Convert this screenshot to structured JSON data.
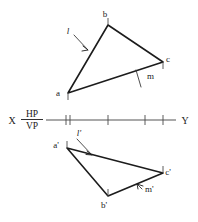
{
  "figure": {
    "width": 198,
    "height": 222,
    "background_color": "#ffffff",
    "line_color": "#1c1c1c",
    "leader_color": "#3a3a3a",
    "axis_color": "#555555"
  },
  "reference_line": {
    "name": "XY line",
    "left_label": "X",
    "right_label": "Y",
    "upper_plane_label": "HP",
    "lower_plane_label": "VP",
    "x_start": 46,
    "x_end": 176,
    "y": 120,
    "ticks": [
      66,
      70,
      108,
      145,
      163
    ]
  },
  "top_view": {
    "name": "plan",
    "vertices": [
      {
        "id": "a",
        "label": "a",
        "x": 68,
        "y": 93,
        "label_x": 58,
        "label_y": 96
      },
      {
        "id": "b",
        "label": "b",
        "x": 108,
        "y": 25,
        "label_x": 105,
        "label_y": 17
      },
      {
        "id": "c",
        "label": "c",
        "x": 163,
        "y": 62,
        "label_x": 168,
        "label_y": 62
      }
    ],
    "edge_labels": [
      {
        "id": "l",
        "label": "l",
        "label_x": 68,
        "label_y": 34,
        "tip_x": 88,
        "tip_y": 50
      },
      {
        "id": "m",
        "label": "m",
        "label_x": 147,
        "label_y": 79,
        "tip_x": 136,
        "tip_y": 70
      }
    ]
  },
  "front_view": {
    "name": "elevation",
    "vertices": [
      {
        "id": "a-prime",
        "label": "a'",
        "x": 67,
        "y": 148,
        "label_x": 56,
        "label_y": 148
      },
      {
        "id": "b-prime",
        "label": "b'",
        "x": 108,
        "y": 196,
        "label_x": 104,
        "label_y": 208
      },
      {
        "id": "c-prime",
        "label": "c'",
        "x": 163,
        "y": 173,
        "label_x": 168,
        "label_y": 175
      }
    ],
    "edge_labels": [
      {
        "id": "l-prime",
        "label": "l'",
        "label_x": 79,
        "label_y": 136,
        "tip_x": 92,
        "tip_y": 155
      },
      {
        "id": "m-prime",
        "label": "m'",
        "label_x": 145,
        "label_y": 192,
        "tip_x": 137,
        "tip_y": 184
      }
    ]
  }
}
